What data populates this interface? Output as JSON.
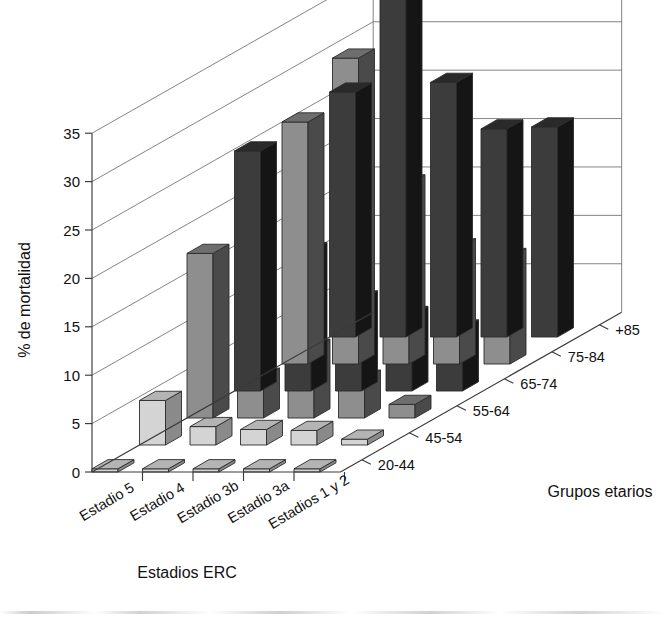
{
  "figure": {
    "background": "#ffffff",
    "width": 666,
    "height": 619
  },
  "axes": {
    "y_title": "% de mortalidad",
    "x_title": "Estadios ERC",
    "z_title": "Grupos etarios",
    "y_ticks": [
      "0",
      "5",
      "10",
      "15",
      "20",
      "25",
      "30",
      "35"
    ],
    "x_categories": [
      "Estadio 5",
      "Estadio 4",
      "Estadio 3b",
      "Estadio 3a",
      "Estadios 1 y 2"
    ],
    "z_categories": [
      "20-44",
      "45-54",
      "55-64",
      "65-74",
      "75-84",
      "+85"
    ]
  },
  "style": {
    "face_light": "#d4d4d4",
    "face_mid": "#8e8e8e",
    "face_dark": "#3c3c3c",
    "side_light": "#8a8a8a",
    "side_mid": "#4a4a4a",
    "side_dark": "#151515",
    "top_light": "#b4b4b4",
    "top_mid": "#6e6e6e",
    "top_dark": "#2a2a2a",
    "outline": "#2b2b2b",
    "grid": "#6e6e6e",
    "axis": "#3a3a3a"
  },
  "chart_data": {
    "type": "bar",
    "title": "",
    "subtitle": "",
    "xlabel": "Estadios ERC",
    "ylabel": "% de mortalidad",
    "zlabel": "Grupos etarios",
    "ylim": [
      0,
      35
    ],
    "ytick_step": 5,
    "grid": true,
    "legend": "none",
    "projection": "3d",
    "categories": [
      "Estadio 5",
      "Estadio 4",
      "Estadio 3b",
      "Estadio 3a",
      "Estadios 1 y 2"
    ],
    "series": [
      {
        "name": "20-44",
        "shade": "light",
        "values": [
          0.0,
          0.0,
          0.0,
          0.0,
          0.2
        ]
      },
      {
        "name": "45-54",
        "shade": "light",
        "values": [
          4.6,
          1.9,
          1.6,
          1.5,
          0.6
        ]
      },
      {
        "name": "55-64",
        "shade": "mid",
        "values": [
          17.0,
          4.2,
          7.2,
          4.0,
          1.4
        ]
      },
      {
        "name": "65-74",
        "shade": "dark",
        "values": [
          24.8,
          14.4,
          9.4,
          7.8,
          6.4
        ]
      },
      {
        "name": "75-84",
        "shade": "mid",
        "values": [
          25.0,
          31.6,
          18.6,
          12.0,
          11.0
        ]
      },
      {
        "name": "+85",
        "shade": "dark",
        "values": [
          25.3,
          38.6,
          26.3,
          21.5,
          21.7
        ]
      }
    ]
  }
}
